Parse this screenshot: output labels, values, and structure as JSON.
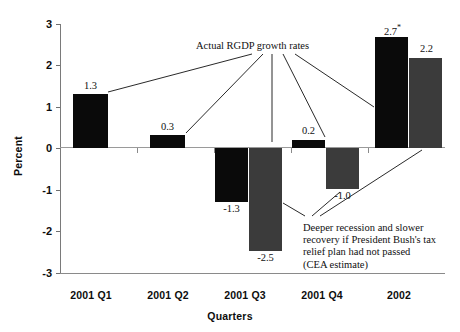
{
  "chart_data": {
    "type": "bar",
    "title": "",
    "xlabel": "Quarters",
    "ylabel": "Percent",
    "categories": [
      "2001 Q1",
      "2001 Q2",
      "2001 Q3",
      "2001 Q4",
      "2002"
    ],
    "series": [
      {
        "name": "Actual RGDP growth rates",
        "color": "#0a0a0a",
        "values": [
          1.3,
          0.3,
          -1.3,
          0.2,
          2.7
        ],
        "labels": [
          "1.3",
          "0.3",
          "-1.3",
          "0.2",
          "2.7*"
        ]
      },
      {
        "name": "CEA estimate (no tax relief plan)",
        "color": "#3b3b3b",
        "values": [
          null,
          null,
          -2.5,
          -1.0,
          2.2
        ],
        "labels": [
          "",
          "",
          "-2.5",
          "-1.0",
          "2.2"
        ]
      }
    ],
    "ylim": [
      -3,
      3
    ],
    "yticks": [
      "3",
      "2",
      "1",
      "0",
      "-1",
      "-2",
      "-3"
    ],
    "ytick_values": [
      3,
      2,
      1,
      0,
      -1,
      -2,
      -3
    ],
    "grid": false,
    "legend": "none",
    "annotations": [
      {
        "id": "actual",
        "text": "Actual RGDP growth rates"
      },
      {
        "id": "cea",
        "line1": "Deeper recession and slower",
        "line2": "recovery if President Bush's tax",
        "line3": "relief plan had not passed",
        "line4": "(CEA estimate)"
      }
    ]
  },
  "axis": {
    "y_title": "Percent",
    "x_title": "Quarters"
  }
}
